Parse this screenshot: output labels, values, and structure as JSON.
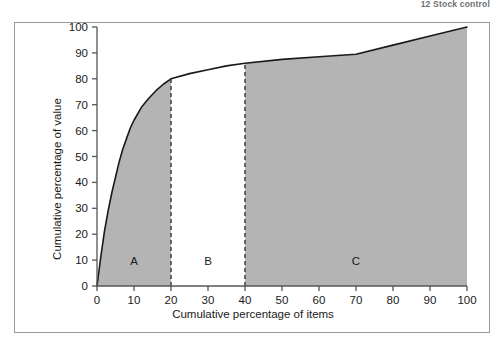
{
  "running_head": "12 Stock control",
  "chart_data": {
    "type": "area",
    "title": "",
    "subtitle": "",
    "xlabel": "Cumulative percentage of items",
    "ylabel": "Cumulative percentage of value",
    "xlim": [
      0,
      100
    ],
    "ylim": [
      0,
      100
    ],
    "xticks": [
      0,
      10,
      20,
      30,
      40,
      50,
      60,
      70,
      80,
      90,
      100
    ],
    "yticks": [
      0,
      10,
      20,
      30,
      40,
      50,
      60,
      70,
      80,
      90,
      100
    ],
    "grid": false,
    "legend": "none",
    "curve_name": "Pareto cumulative value curve",
    "x": [
      0,
      1,
      2,
      3,
      4,
      5,
      6,
      7,
      8,
      9,
      10,
      12,
      14,
      16,
      18,
      20,
      25,
      30,
      35,
      40,
      50,
      60,
      70,
      80,
      90,
      100
    ],
    "y": [
      0,
      11,
      21,
      29,
      36,
      42,
      48,
      53,
      57,
      61,
      64,
      69,
      72.5,
      75.5,
      78,
      80,
      82,
      83.5,
      85,
      86,
      87.5,
      88.5,
      89.5,
      93,
      96.5,
      100
    ],
    "annotations": [
      {
        "label": "A",
        "x": 10,
        "y": 8,
        "region": [
          0,
          20
        ],
        "shaded": true
      },
      {
        "label": "B",
        "x": 30,
        "y": 8,
        "region": [
          20,
          40
        ],
        "shaded": false
      },
      {
        "label": "C",
        "x": 70,
        "y": 8,
        "region": [
          40,
          100
        ],
        "shaded": true
      }
    ],
    "dividers": [
      20,
      40
    ],
    "colors": {
      "fill": "#b4b4b4",
      "curve": "#1a1a1a",
      "axis": "#555555",
      "divider": "#333333",
      "frame": "#9a9a9a"
    }
  }
}
